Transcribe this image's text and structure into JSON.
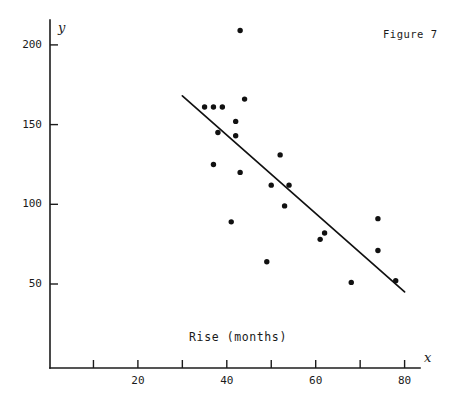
{
  "figure": {
    "caption": "Figure 7",
    "background_color": "#ffffff",
    "ink_color": "#111111"
  },
  "chart_data": {
    "type": "scatter",
    "title": "",
    "caption": "Figure 7",
    "xlabel": "Rise (months)",
    "ylabel": "",
    "x_axis_name": "x",
    "y_axis_name": "y",
    "xlim": [
      5,
      82
    ],
    "ylim": [
      25,
      215
    ],
    "grid": false,
    "legend": null,
    "x_ticks": [
      10,
      20,
      30,
      40,
      50,
      60,
      70,
      80
    ],
    "x_tick_labels": [
      "",
      "20",
      "",
      "40",
      "",
      "60",
      "",
      "80"
    ],
    "y_ticks": [
      50,
      100,
      150,
      200
    ],
    "y_tick_labels": [
      "50",
      "100",
      "150",
      "200"
    ],
    "points": [
      {
        "x": 43,
        "y": 209
      },
      {
        "x": 44,
        "y": 166
      },
      {
        "x": 35,
        "y": 161
      },
      {
        "x": 37,
        "y": 161
      },
      {
        "x": 39,
        "y": 161
      },
      {
        "x": 42,
        "y": 152
      },
      {
        "x": 38,
        "y": 145
      },
      {
        "x": 42,
        "y": 143
      },
      {
        "x": 52,
        "y": 131
      },
      {
        "x": 37,
        "y": 125
      },
      {
        "x": 43,
        "y": 120
      },
      {
        "x": 50,
        "y": 112
      },
      {
        "x": 54,
        "y": 112
      },
      {
        "x": 53,
        "y": 99
      },
      {
        "x": 74,
        "y": 91
      },
      {
        "x": 41,
        "y": 89
      },
      {
        "x": 62,
        "y": 82
      },
      {
        "x": 61,
        "y": 78
      },
      {
        "x": 74,
        "y": 71
      },
      {
        "x": 49,
        "y": 64
      },
      {
        "x": 78,
        "y": 52
      },
      {
        "x": 68,
        "y": 51
      }
    ],
    "fit_line": {
      "name": "least-squares line",
      "x_start": 30,
      "y_start": 168,
      "x_end": 80,
      "y_end": 45
    }
  }
}
